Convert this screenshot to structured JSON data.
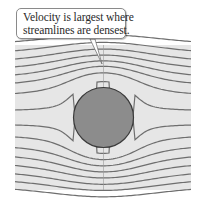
{
  "callout": {
    "line1": "Velocity is largest where",
    "line2": "streamlines are densest."
  },
  "diagram": {
    "panel": {
      "x": 15,
      "y": 45,
      "width": 176,
      "height": 145,
      "fill": "#e6e6e6"
    },
    "obstacle": {
      "cx": 103.5,
      "cy": 117.5,
      "r": 30,
      "fill": "#8c8c8c",
      "stroke": "#3a3a3a"
    },
    "streamline_color": "#6e6e6e",
    "streamline_far_offsets": [
      -70,
      -61,
      -53,
      -45.5,
      -38,
      -30.5,
      -21,
      -6.5,
      6.5,
      17,
      26.5,
      35,
      43,
      51,
      58.5,
      66
    ],
    "centerline_x": 103.5,
    "pointer": {
      "base_left": [
        90,
        39
      ],
      "base_right": [
        95,
        39
      ],
      "tip": [
        102,
        64
      ]
    }
  }
}
